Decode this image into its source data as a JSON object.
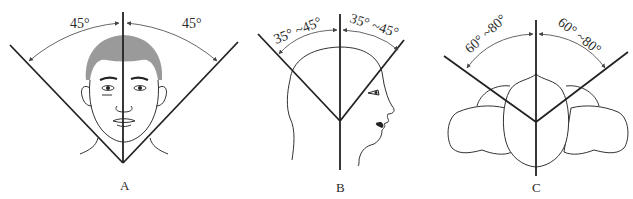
{
  "figure": {
    "panels": [
      {
        "id": "A",
        "label": "A",
        "view": "frontal face",
        "left_angle": "45°",
        "right_angle": "45°"
      },
      {
        "id": "B",
        "label": "B",
        "view": "lateral head profile",
        "left_angle": "35° ~45°",
        "right_angle": "35° ~45°"
      },
      {
        "id": "C",
        "label": "C",
        "view": "top-down head with shoulders",
        "left_angle": "60° ~80°",
        "right_angle": "60° ~80°"
      }
    ],
    "colors": {
      "line": "#222222",
      "hair": "#9a9a9a",
      "background": "#ffffff"
    }
  }
}
